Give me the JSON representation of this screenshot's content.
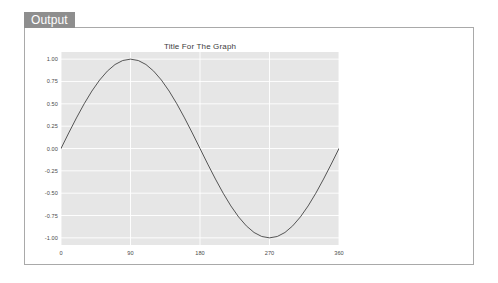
{
  "tab": {
    "label": "Output"
  },
  "panel": {
    "background": "#ffffff",
    "border_color": "#a9a9a9"
  },
  "chart_data": {
    "type": "line",
    "title": "Title For The Graph",
    "xlabel": "",
    "ylabel": "",
    "xlim": [
      0,
      360
    ],
    "ylim": [
      -1.08,
      1.08
    ],
    "grid": true,
    "legend": null,
    "plot_background": "#e6e6e6",
    "grid_color": "#ffffff",
    "line_color": "#555555",
    "line_width": 1,
    "xticks": [
      "0",
      "90",
      "180",
      "270",
      "360"
    ],
    "xtick_values": [
      0,
      90,
      180,
      270,
      360
    ],
    "yticks": [
      "1.00",
      "0.75",
      "0.50",
      "0.25",
      "0.00",
      "-0.25",
      "-0.50",
      "-0.75",
      "-1.00"
    ],
    "ytick_values": [
      1.0,
      0.75,
      0.5,
      0.25,
      0.0,
      -0.25,
      -0.5,
      -0.75,
      -1.0
    ],
    "series": [
      {
        "name": "sin(x)",
        "x": [
          0,
          10,
          20,
          30,
          40,
          50,
          60,
          70,
          80,
          90,
          100,
          110,
          120,
          130,
          140,
          150,
          160,
          170,
          180,
          190,
          200,
          210,
          220,
          230,
          240,
          250,
          260,
          270,
          280,
          290,
          300,
          310,
          320,
          330,
          340,
          350,
          360
        ],
        "values": [
          0.0,
          0.174,
          0.342,
          0.5,
          0.643,
          0.766,
          0.866,
          0.94,
          0.985,
          1.0,
          0.985,
          0.94,
          0.866,
          0.766,
          0.643,
          0.5,
          0.342,
          0.174,
          0.0,
          -0.174,
          -0.342,
          -0.5,
          -0.643,
          -0.766,
          -0.866,
          -0.94,
          -0.985,
          -1.0,
          -0.985,
          -0.94,
          -0.866,
          -0.766,
          -0.643,
          -0.5,
          -0.342,
          -0.174,
          0.0
        ]
      }
    ]
  }
}
